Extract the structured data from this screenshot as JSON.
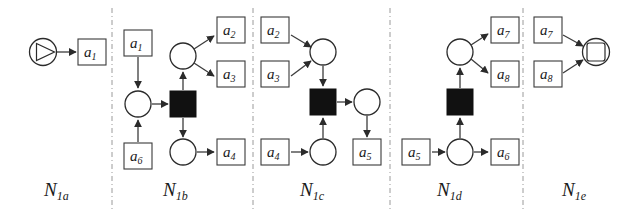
{
  "figure": {
    "background": "#ffffff",
    "ink": "#1a1a1a",
    "separator_color": "#9a9a9a",
    "transition_fill": "#111111",
    "place_fill": "#ffffff"
  },
  "panels": [
    {
      "id": "N1a",
      "label_main": "N",
      "label_sub": "1a",
      "start_marker": "start-circle-triangle-icon",
      "activities": [
        "a1"
      ],
      "activity_labels": [
        {
          "base": "a",
          "sub": "1"
        }
      ]
    },
    {
      "id": "N1b",
      "label_main": "N",
      "label_sub": "1b",
      "inputs": [
        {
          "base": "a",
          "sub": "1"
        },
        {
          "base": "a",
          "sub": "6"
        }
      ],
      "outputs": [
        {
          "base": "a",
          "sub": "2"
        },
        {
          "base": "a",
          "sub": "3"
        },
        {
          "base": "a",
          "sub": "4"
        }
      ]
    },
    {
      "id": "N1c",
      "label_main": "N",
      "label_sub": "1c",
      "inputs": [
        {
          "base": "a",
          "sub": "2"
        },
        {
          "base": "a",
          "sub": "3"
        },
        {
          "base": "a",
          "sub": "4"
        }
      ],
      "outputs": [
        {
          "base": "a",
          "sub": "5"
        }
      ]
    },
    {
      "id": "N1d",
      "label_main": "N",
      "label_sub": "1d",
      "inputs": [
        {
          "base": "a",
          "sub": "5"
        }
      ],
      "outputs": [
        {
          "base": "a",
          "sub": "7"
        },
        {
          "base": "a",
          "sub": "8"
        },
        {
          "base": "a",
          "sub": "6"
        }
      ]
    },
    {
      "id": "N1e",
      "label_main": "N",
      "label_sub": "1e",
      "end_marker": "end-circle-square-icon",
      "inputs": [
        {
          "base": "a",
          "sub": "7"
        },
        {
          "base": "a",
          "sub": "8"
        }
      ]
    }
  ],
  "activity_text": {
    "a1_p1": "a",
    "a1_p1_sub": "1",
    "a1_p2": "a",
    "a1_p2_sub": "1",
    "a6_p2": "a",
    "a6_p2_sub": "6",
    "a2_p2": "a",
    "a2_p2_sub": "2",
    "a3_p2": "a",
    "a3_p2_sub": "3",
    "a4_p2": "a",
    "a4_p2_sub": "4",
    "a2_p3": "a",
    "a2_p3_sub": "2",
    "a3_p3": "a",
    "a3_p3_sub": "3",
    "a4_p3": "a",
    "a4_p3_sub": "4",
    "a5_p3": "a",
    "a5_p3_sub": "5",
    "a5_p4": "a",
    "a5_p4_sub": "5",
    "a6_p4": "a",
    "a6_p4_sub": "6",
    "a7_p4": "a",
    "a7_p4_sub": "7",
    "a8_p4": "a",
    "a8_p4_sub": "8",
    "a7_p5": "a",
    "a7_p5_sub": "7",
    "a8_p5": "a",
    "a8_p5_sub": "8"
  },
  "labels": {
    "n1a": "N",
    "n1a_sub": "1a",
    "n1b": "N",
    "n1b_sub": "1b",
    "n1c": "N",
    "n1c_sub": "1c",
    "n1d": "N",
    "n1d_sub": "1d",
    "n1e": "N",
    "n1e_sub": "1e"
  }
}
